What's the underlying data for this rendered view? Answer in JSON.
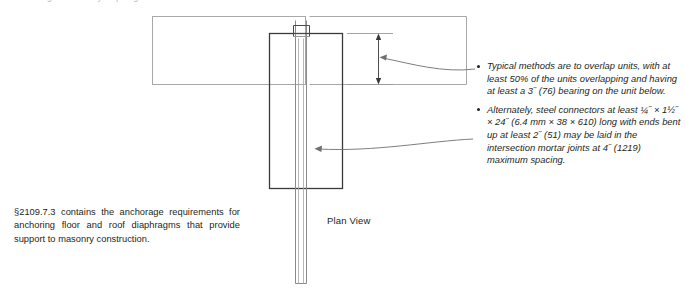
{
  "figure": {
    "top_caption": "anchorage of masonry diaphragm",
    "plan_view_label": "Plan View",
    "colors": {
      "line_dark": "#231f20",
      "line_medium": "#6f6f6f",
      "line_light": "#b3b3b3",
      "text": "#231f20",
      "background": "#ffffff"
    },
    "shapes": {
      "slab_rect": "light outlined rectangle representing floor slab",
      "unit_rect": "dark outlined rectangle representing masonry unit",
      "wall_strip": "vertical narrow strip representing masonry wall",
      "dimension_line": "vertical dimension with arrowheads at both ends"
    }
  },
  "code_note": {
    "text": "§2109.7.3 contains the anchorage requirements for anchoring floor and roof diaphragms that provide support to masonry construction."
  },
  "callouts": {
    "items": [
      {
        "id": "overlap-units",
        "text": "Typical methods are to overlap units, with at least 50% of the units overlapping and having at least a 3˝ (76) bearing on the unit below."
      },
      {
        "id": "steel-connectors",
        "text": "Alternately, steel connectors at least ¼˝ × 1½˝ × 24˝ (6.4 mm × 38 × 610) long with ends bent up at least 2˝ (51) may be laid in the intersection mortar joints at 4˝ (1219) maximum spacing."
      }
    ]
  }
}
